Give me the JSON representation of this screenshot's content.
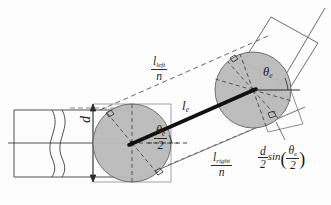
{
  "figure": {
    "background_color": "#fdfdfd",
    "line_color": "#2a2a2a",
    "circle_fill_color": "#b9b9b9",
    "circle_stroke_color": "#6e6e6e",
    "thick_line_color": "#111111"
  },
  "labels": {
    "l_left_num": "l",
    "l_left_num_sub": "left",
    "l_left_den": "n",
    "l_right_num": "l",
    "l_right_num_sub": "right",
    "l_right_den": "n",
    "l_e_main": "l",
    "l_e_sub": "e",
    "theta_e_symbol": "θ",
    "theta_e_sub": "e",
    "theta_half_symbol": "θ",
    "theta_half_sub": "e",
    "theta_half_den": "2",
    "diameter": "d",
    "dsin_num": "d",
    "dsin_den": "2",
    "dsin_func": "sin",
    "dsin_open_paren": "(",
    "dsin_close_paren": ")",
    "dsin_theta": "θ",
    "dsin_theta_sub": "e",
    "dsin_theta_den": "2"
  },
  "geometry": {
    "left_circle": {
      "cx": 132,
      "cy": 143,
      "r": 39
    },
    "right_circle": {
      "cx": 253,
      "cy": 90,
      "r": 38
    },
    "thick_line": {
      "x1": 132,
      "y1": 143,
      "x2": 253,
      "y2": 90
    },
    "horizontal_axis_y": 143,
    "theta_e_degrees": 24,
    "pipe_top_y": 110,
    "pipe_bottom_y": 177
  }
}
